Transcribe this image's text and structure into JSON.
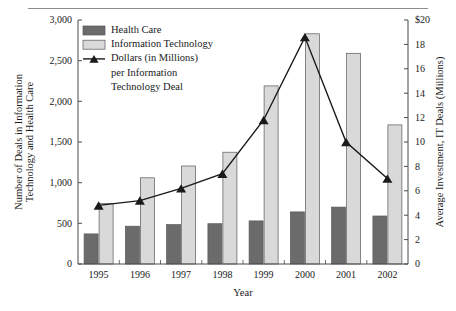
{
  "chart_data": {
    "type": "bar",
    "title": "",
    "subtitle": "",
    "xlabel": "Year",
    "ylabel": "Number of Deals in Information Technology and Health Care",
    "y2label": "Average Investment, IT Deals (Millions)",
    "categories": [
      "1995",
      "1996",
      "1997",
      "1998",
      "1999",
      "2000",
      "2001",
      "2002"
    ],
    "ylim": [
      0,
      3000
    ],
    "y2lim": [
      0,
      20
    ],
    "yticks": [
      "0",
      "500",
      "1,000",
      "1,500",
      "2,000",
      "2,500",
      "3,000"
    ],
    "ytick_values": [
      0,
      500,
      1000,
      1500,
      2000,
      2500,
      3000
    ],
    "y2ticks": [
      "0",
      "2",
      "4",
      "6",
      "8",
      "10",
      "12",
      "14",
      "16",
      "18",
      "$20"
    ],
    "y2tick_values": [
      0,
      2,
      4,
      6,
      8,
      10,
      12,
      14,
      16,
      18,
      20
    ],
    "grid": false,
    "legend_position": "top-left",
    "series": [
      {
        "name": "Health Care",
        "kind": "bar",
        "axis": "left",
        "color": "#6b6b6b",
        "values": [
          370,
          465,
          485,
          495,
          530,
          640,
          700,
          590
        ]
      },
      {
        "name": "Information Technology",
        "kind": "bar",
        "axis": "left",
        "color": "#d9d9d9",
        "values": [
          745,
          1060,
          1205,
          1375,
          2190,
          2830,
          2590,
          1710
        ]
      },
      {
        "name": "Dollars (in Millions) per Information Technology Deal",
        "kind": "line",
        "axis": "right",
        "color": "#1a1a1a",
        "marker": "triangle",
        "values": [
          4.8,
          5.2,
          6.2,
          7.4,
          11.8,
          18.6,
          10.0,
          7.0
        ]
      }
    ]
  },
  "legend": {
    "items": [
      {
        "label": "Health Care",
        "swatch": "bar-dark"
      },
      {
        "label": "Information Technology",
        "swatch": "bar-light"
      },
      {
        "label": "Dollars (in Millions)",
        "swatch": "line-marker"
      },
      {
        "label": "per Information",
        "swatch": "none"
      },
      {
        "label": "Technology Deal",
        "swatch": "none"
      }
    ]
  },
  "colors": {
    "health_care": "#6b6b6b",
    "info_tech": "#d9d9d9",
    "line": "#1a1a1a",
    "axis": "#4a4a4a",
    "rule": "#8d8d8d"
  }
}
